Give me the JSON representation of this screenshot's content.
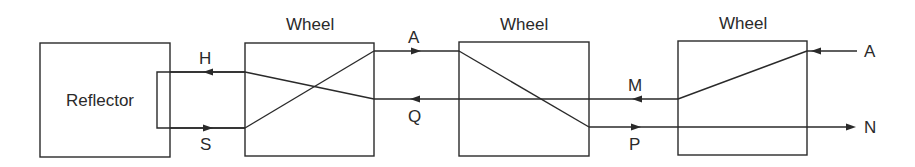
{
  "diagram": {
    "type": "enigma-rotor-signal-path",
    "components": {
      "reflector": {
        "label": "Reflector"
      },
      "wheel_left": {
        "label": "Wheel"
      },
      "wheel_middle": {
        "label": "Wheel"
      },
      "wheel_right": {
        "label": "Wheel"
      }
    },
    "signals": {
      "input": "A",
      "output": "N",
      "between_wheel3_wheel2_return": "M",
      "between_wheel3_wheel2_forward": "P",
      "between_wheel2_wheel1_forward": "A",
      "between_wheel2_wheel1_return": "Q",
      "reflector_in": "S",
      "reflector_out": "H"
    },
    "colors": {
      "stroke": "#2a2a2a",
      "background": "#ffffff"
    }
  }
}
